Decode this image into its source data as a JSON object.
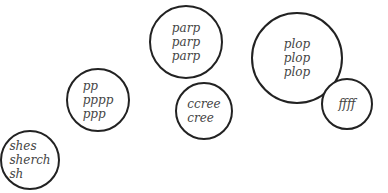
{
  "diagram": {
    "circles": [
      {
        "id": "pp",
        "cx": 98,
        "cy": 100,
        "r": 32,
        "lines": [
          "pp",
          "pppp",
          "ppp"
        ]
      },
      {
        "id": "shes",
        "cx": 30,
        "cy": 160,
        "r": 30,
        "lines": [
          "shes",
          "sherch",
          "sh"
        ]
      },
      {
        "id": "parp",
        "cx": 186,
        "cy": 42,
        "r": 37,
        "lines": [
          "parp",
          "parp",
          "parp"
        ]
      },
      {
        "id": "ccree",
        "cx": 204,
        "cy": 111,
        "r": 29,
        "lines": [
          "ccree",
          "cree"
        ]
      },
      {
        "id": "plop",
        "cx": 297,
        "cy": 58,
        "r": 46,
        "lines": [
          "plop",
          "plop",
          "plop"
        ]
      },
      {
        "id": "ffff",
        "cx": 347,
        "cy": 104,
        "r": 26,
        "lines": [
          "ffff"
        ]
      }
    ]
  }
}
